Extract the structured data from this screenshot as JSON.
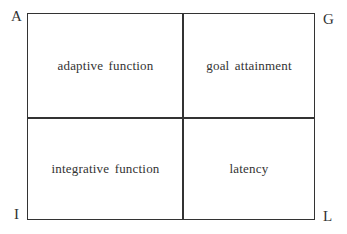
{
  "diagram": {
    "type": "2x2 quadrant grid",
    "corners": {
      "top_left": "A",
      "top_right": "G",
      "bottom_left": "I",
      "bottom_right": "L"
    },
    "quadrants": {
      "top_left": "adaptive function",
      "top_right": "goal attainment",
      "bottom_left": "integrative function",
      "bottom_right": "latency"
    },
    "colors": {
      "line": "#333333",
      "text": "#333333",
      "background": "#ffffff"
    }
  }
}
